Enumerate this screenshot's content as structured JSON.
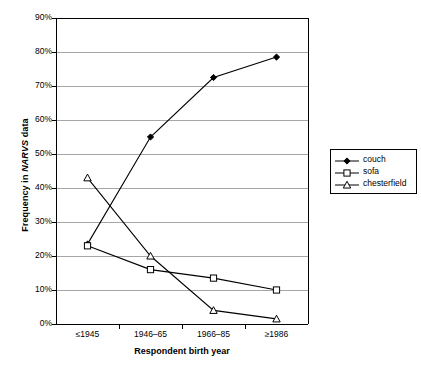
{
  "chart_data": {
    "type": "line",
    "title": "",
    "xlabel": "Respondent birth year",
    "ylabel": "Frequency in NARVS data",
    "ylabel_plain": "Frequency in ",
    "ylabel_emph": "NARVS",
    "ylabel_tail": " data",
    "categories": [
      "≤1945",
      "1946–65",
      "1966–85",
      "≥1986"
    ],
    "ylim": [
      0,
      90
    ],
    "ytick_labels": [
      "0%",
      "10%",
      "20%",
      "30%",
      "40%",
      "50%",
      "60%",
      "70%",
      "80%",
      "90%"
    ],
    "ytick_values": [
      0,
      10,
      20,
      30,
      40,
      50,
      60,
      70,
      80,
      90
    ],
    "grid": true,
    "legend_position": "right",
    "series": [
      {
        "name": "couch",
        "marker": "filled-diamond",
        "color": "#000000",
        "values": [
          23.5,
          55.0,
          72.5,
          78.5
        ]
      },
      {
        "name": "sofa",
        "marker": "open-square",
        "color": "#000000",
        "values": [
          23.0,
          16.0,
          13.5,
          10.0
        ]
      },
      {
        "name": "chesterfield",
        "marker": "open-triangle",
        "color": "#000000",
        "values": [
          43.0,
          20.0,
          4.0,
          1.5
        ]
      }
    ]
  },
  "legend": {
    "items": [
      {
        "label": "couch",
        "marker": "filled-diamond"
      },
      {
        "label": "sofa",
        "marker": "open-square"
      },
      {
        "label": "chesterfield",
        "marker": "open-triangle"
      }
    ]
  },
  "colors": {
    "line": "#000000",
    "grid": "#a6a6a6",
    "axis": "#000000",
    "background": "#ffffff"
  }
}
